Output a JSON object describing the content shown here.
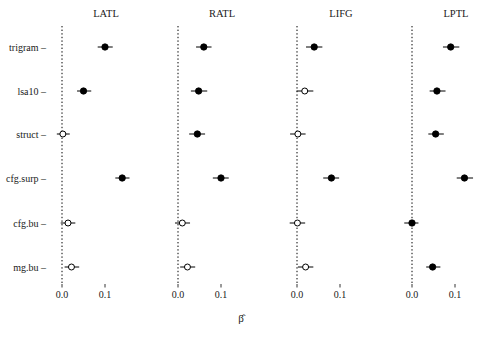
{
  "figure": {
    "title": "",
    "axis_title": "β̂",
    "axis_title_plain": "beta-hat",
    "background_color": "#ffffff",
    "point_color": "#000000",
    "line_color": "#000000"
  },
  "chart_data": {
    "type": "scatter",
    "title": "",
    "subtitle": "",
    "xlabel": "β̂",
    "ylabel": "",
    "xlim": [
      -0.02,
      0.165
    ],
    "xticks": [
      0.0,
      0.1
    ],
    "xtick_labels": [
      "0.0",
      "0.1"
    ],
    "grid": false,
    "legend": "none",
    "reference_line": 0.0,
    "reference_line_style": "dotted",
    "categories": [
      "trigram",
      "lsa10",
      "struct",
      "cfg.surp",
      "cfg.bu",
      "mg.bu"
    ],
    "panels": [
      {
        "name": "LATL",
        "points": [
          {
            "category": "trigram",
            "estimate": 0.1,
            "ci_low": 0.083,
            "ci_high": 0.118,
            "filled": true,
            "significant": true
          },
          {
            "category": "lsa10",
            "estimate": 0.05,
            "ci_low": 0.035,
            "ci_high": 0.068,
            "filled": true,
            "significant": true
          },
          {
            "category": "struct",
            "estimate": 0.002,
            "ci_low": -0.012,
            "ci_high": 0.018,
            "filled": false,
            "significant": false
          },
          {
            "category": "cfg.surp",
            "estimate": 0.14,
            "ci_low": 0.124,
            "ci_high": 0.157,
            "filled": true,
            "significant": true
          },
          {
            "category": "cfg.bu",
            "estimate": 0.014,
            "ci_low": -0.003,
            "ci_high": 0.031,
            "filled": false,
            "significant": false
          },
          {
            "category": "mg.bu",
            "estimate": 0.022,
            "ci_low": 0.006,
            "ci_high": 0.04,
            "filled": false,
            "significant": false
          }
        ]
      },
      {
        "name": "RATL",
        "points": [
          {
            "category": "trigram",
            "estimate": 0.06,
            "ci_low": 0.042,
            "ci_high": 0.078,
            "filled": true,
            "significant": true
          },
          {
            "category": "lsa10",
            "estimate": 0.048,
            "ci_low": 0.03,
            "ci_high": 0.068,
            "filled": true,
            "significant": true
          },
          {
            "category": "struct",
            "estimate": 0.045,
            "ci_low": 0.026,
            "ci_high": 0.063,
            "filled": true,
            "significant": true
          },
          {
            "category": "cfg.surp",
            "estimate": 0.1,
            "ci_low": 0.081,
            "ci_high": 0.118,
            "filled": true,
            "significant": true
          },
          {
            "category": "cfg.bu",
            "estimate": 0.01,
            "ci_low": -0.007,
            "ci_high": 0.028,
            "filled": false,
            "significant": false
          },
          {
            "category": "mg.bu",
            "estimate": 0.022,
            "ci_low": 0.005,
            "ci_high": 0.04,
            "filled": false,
            "significant": false
          }
        ]
      },
      {
        "name": "LIFG",
        "points": [
          {
            "category": "trigram",
            "estimate": 0.04,
            "ci_low": 0.021,
            "ci_high": 0.059,
            "filled": true,
            "significant": true
          },
          {
            "category": "lsa10",
            "estimate": 0.018,
            "ci_low": -0.001,
            "ci_high": 0.038,
            "filled": false,
            "significant": false
          },
          {
            "category": "struct",
            "estimate": 0.002,
            "ci_low": -0.016,
            "ci_high": 0.02,
            "filled": false,
            "significant": false
          },
          {
            "category": "cfg.surp",
            "estimate": 0.08,
            "ci_low": 0.061,
            "ci_high": 0.098,
            "filled": true,
            "significant": true
          },
          {
            "category": "cfg.bu",
            "estimate": 0.001,
            "ci_low": -0.017,
            "ci_high": 0.019,
            "filled": false,
            "significant": false
          },
          {
            "category": "mg.bu",
            "estimate": 0.02,
            "ci_low": 0.002,
            "ci_high": 0.038,
            "filled": false,
            "significant": false
          }
        ]
      },
      {
        "name": "LPTL",
        "points": [
          {
            "category": "trigram",
            "estimate": 0.09,
            "ci_low": 0.072,
            "ci_high": 0.11,
            "filled": true,
            "significant": true
          },
          {
            "category": "lsa10",
            "estimate": 0.058,
            "ci_low": 0.041,
            "ci_high": 0.078,
            "filled": true,
            "significant": true
          },
          {
            "category": "struct",
            "estimate": 0.055,
            "ci_low": 0.038,
            "ci_high": 0.074,
            "filled": true,
            "significant": true
          },
          {
            "category": "cfg.surp",
            "estimate": 0.122,
            "ci_low": 0.104,
            "ci_high": 0.142,
            "filled": true,
            "significant": true
          },
          {
            "category": "cfg.bu",
            "estimate": 0.0,
            "ci_low": -0.018,
            "ci_high": 0.015,
            "filled": true,
            "significant": false
          },
          {
            "category": "mg.bu",
            "estimate": 0.048,
            "ci_low": 0.033,
            "ci_high": 0.066,
            "filled": true,
            "significant": true
          }
        ]
      }
    ]
  }
}
